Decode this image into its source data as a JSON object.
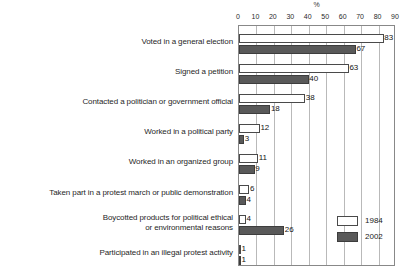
{
  "chart_data": {
    "type": "bar",
    "orientation": "horizontal",
    "title": "",
    "subtitle": "",
    "xlabel": "%",
    "ylabel": "",
    "xlim": [
      0,
      90
    ],
    "xticks": [
      0,
      10,
      20,
      30,
      40,
      50,
      60,
      70,
      80,
      90
    ],
    "xtick_labels": [
      "0",
      "10",
      "20",
      "30",
      "40",
      "50",
      "60",
      "70",
      "80",
      "90"
    ],
    "grid": true,
    "grid_axis": "x",
    "legend_position": "bottom-right",
    "categories": [
      "Voted in a general election",
      "Signed a petition",
      "Contacted a politician or government official",
      "Worked in a political party",
      "Worked in an organized group",
      "Taken part in a protest march or public demonstration",
      "Boycotted products for political ethical\nor environmental reasons",
      "Participated in an illegal protest activity"
    ],
    "series": [
      {
        "name": "1984",
        "color": "#ffffff",
        "edge_color": "#4a4a4a",
        "values": [
          83,
          63,
          38,
          12,
          11,
          6,
          4,
          1
        ],
        "labels": [
          "83",
          "63",
          "38",
          "12",
          "11",
          "6",
          "4",
          "1"
        ]
      },
      {
        "name": "2002",
        "color": "#595959",
        "edge_color": "#3d3d3d",
        "values": [
          67,
          40,
          18,
          3,
          9,
          4,
          26,
          1
        ],
        "labels": [
          "67",
          "40",
          "18",
          "3",
          "9",
          "4",
          "26",
          "1"
        ]
      }
    ]
  },
  "legend": {
    "items": [
      {
        "label": "1984",
        "swatch": "y1984"
      },
      {
        "label": "2002",
        "swatch": "y2002"
      }
    ]
  },
  "axis": {
    "unit_label": "%"
  }
}
